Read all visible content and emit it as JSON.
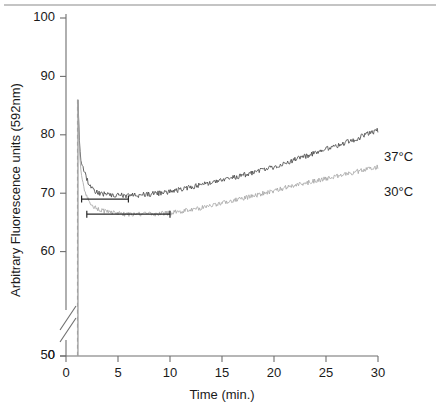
{
  "figure": {
    "top_rule": true,
    "background": "#ffffff"
  },
  "axes": {
    "y": {
      "label": "Arbitrary Fluorescence units (592nm)",
      "ticks": [
        0,
        50,
        60,
        70,
        80,
        90,
        100
      ],
      "tick_labels": [
        "0",
        "50",
        "60",
        "70",
        "80",
        "90",
        "100"
      ],
      "broken_between": [
        0,
        50
      ],
      "range": [
        50,
        100
      ]
    },
    "x": {
      "label": "Time (min.)",
      "ticks": [
        0,
        5,
        10,
        15,
        20,
        25,
        30
      ],
      "tick_labels": [
        "0",
        "5",
        "10",
        "15",
        "20",
        "25",
        "30"
      ],
      "range": [
        0,
        30
      ]
    }
  },
  "series_labels": {
    "hot": "37°C",
    "cool": "30°C"
  },
  "colors": {
    "curve_37": "#4a4a4a",
    "curve_30": "#a8a8a8",
    "axis": "#6e6e6e",
    "annotation": "#2a2a2a"
  },
  "annotations": {
    "bar_upper": {
      "x_start": 1.5,
      "x_end": 6.0,
      "y": 69.0
    },
    "bar_lower": {
      "x_start": 2.0,
      "x_end": 10.0,
      "y": 66.4
    },
    "injection_line_x": 1.1
  },
  "chart_data": {
    "type": "line",
    "title": "",
    "xlabel": "Time (min.)",
    "ylabel": "Arbitrary Fluorescence units (592nm)",
    "xlim": [
      0,
      30
    ],
    "ylim": [
      50,
      100
    ],
    "grid": false,
    "legend_position": "right-inline",
    "noise_amplitude": {
      "hot": 0.45,
      "cool": 0.4
    },
    "series": [
      {
        "name": "37°C",
        "color": "#4a4a4a",
        "spike": {
          "x": 1.15,
          "peak": 86.0,
          "rise_from": 50.0
        },
        "x": [
          1.15,
          1.3,
          1.45,
          1.6,
          1.8,
          2.0,
          2.3,
          2.6,
          3.0,
          3.5,
          4.0,
          5.0,
          6.0,
          7.0,
          8.0,
          9.0,
          10.0,
          11.0,
          12.0,
          13.0,
          14.0,
          15.0,
          16.0,
          17.0,
          18.0,
          19.0,
          20.0,
          21.0,
          22.0,
          23.0,
          24.0,
          25.0,
          26.0,
          27.0,
          28.0,
          29.0,
          30.0
        ],
        "values": [
          86.0,
          78.5,
          75.2,
          74.6,
          73.8,
          72.4,
          71.2,
          70.5,
          70.1,
          69.9,
          69.7,
          69.6,
          69.6,
          69.7,
          69.8,
          70.0,
          70.2,
          70.6,
          71.0,
          71.4,
          71.8,
          72.2,
          72.6,
          73.1,
          73.5,
          74.0,
          74.5,
          75.1,
          75.7,
          76.3,
          76.9,
          77.5,
          78.1,
          78.7,
          79.4,
          80.1,
          80.8
        ]
      },
      {
        "name": "30°C",
        "color": "#a8a8a8",
        "spike": {
          "x": 1.15,
          "peak": 86.0,
          "rise_from": 50.0
        },
        "x": [
          1.15,
          1.3,
          1.45,
          1.6,
          1.8,
          2.0,
          2.3,
          2.6,
          3.0,
          3.5,
          4.0,
          5.0,
          6.0,
          7.0,
          8.0,
          9.0,
          10.0,
          11.0,
          12.0,
          13.0,
          14.0,
          15.0,
          16.0,
          17.0,
          18.0,
          19.0,
          20.0,
          21.0,
          22.0,
          23.0,
          24.0,
          25.0,
          26.0,
          27.0,
          28.0,
          29.0,
          30.0
        ],
        "values": [
          86.0,
          77.0,
          73.5,
          72.0,
          70.6,
          69.4,
          68.4,
          67.8,
          67.3,
          67.0,
          66.8,
          66.5,
          66.4,
          66.4,
          66.4,
          66.5,
          66.6,
          66.9,
          67.2,
          67.5,
          67.9,
          68.3,
          68.7,
          69.1,
          69.5,
          70.0,
          70.4,
          70.9,
          71.3,
          71.7,
          72.1,
          72.5,
          72.9,
          73.3,
          73.7,
          74.1,
          74.5
        ]
      }
    ]
  }
}
